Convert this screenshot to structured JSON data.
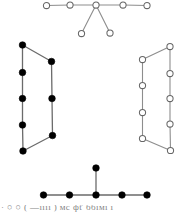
{
  "figure": {
    "background_color": "#ffffff",
    "width": 187,
    "height": 215,
    "node_open_fill": "#ffffff",
    "node_open_stroke": "#676767",
    "node_filled_fill": "#000000",
    "edge_color": "#8d8d8d",
    "node_radius_open": 3.1,
    "node_radius_filled": 3.3
  },
  "caption": {
    "text": "·  ○ ○  ( —ıııı )   мс фť ббıмı  ı",
    "visible": true,
    "cropped": true
  },
  "graphs": [
    {
      "id": "graph-top",
      "name": "top-spider-graph",
      "node_style": "open",
      "node_count": 7,
      "edge_count": 6,
      "nodes": [
        {
          "id": "t0",
          "x": 46.5,
          "y": 5.5
        },
        {
          "id": "t1",
          "x": 70.0,
          "y": 5.0
        },
        {
          "id": "t2",
          "x": 96.0,
          "y": 5.0
        },
        {
          "id": "t3",
          "x": 123.0,
          "y": 5.0
        },
        {
          "id": "t4",
          "x": 147.0,
          "y": 5.5
        },
        {
          "id": "t5",
          "x": 81.5,
          "y": 33.5
        },
        {
          "id": "t6",
          "x": 110.0,
          "y": 33.0
        }
      ],
      "edges": [
        [
          "t0",
          "t1"
        ],
        [
          "t1",
          "t2"
        ],
        [
          "t2",
          "t3"
        ],
        [
          "t3",
          "t4"
        ],
        [
          "t2",
          "t5"
        ],
        [
          "t2",
          "t6"
        ]
      ]
    },
    {
      "id": "graph-left",
      "name": "left-cycle-graph",
      "node_style": "filled",
      "node_count": 8,
      "edge_count": 8,
      "nodes": [
        {
          "id": "l0",
          "x": 22.5,
          "y": 45.0
        },
        {
          "id": "l1",
          "x": 22.5,
          "y": 72.5
        },
        {
          "id": "l2",
          "x": 22.5,
          "y": 98.5
        },
        {
          "id": "l3",
          "x": 22.5,
          "y": 125.0
        },
        {
          "id": "l4",
          "x": 23.0,
          "y": 151.0
        },
        {
          "id": "l5",
          "x": 51.5,
          "y": 61.5
        },
        {
          "id": "l6",
          "x": 52.0,
          "y": 98.5
        },
        {
          "id": "l7",
          "x": 52.5,
          "y": 135.5
        }
      ],
      "edges": [
        [
          "l0",
          "l1"
        ],
        [
          "l1",
          "l2"
        ],
        [
          "l2",
          "l3"
        ],
        [
          "l3",
          "l4"
        ],
        [
          "l0",
          "l5"
        ],
        [
          "l5",
          "l6"
        ],
        [
          "l6",
          "l7"
        ],
        [
          "l7",
          "l4"
        ]
      ]
    },
    {
      "id": "graph-right",
      "name": "right-cycle-graph",
      "node_style": "open",
      "node_count": 9,
      "edge_count": 9,
      "nodes": [
        {
          "id": "r0",
          "x": 170.0,
          "y": 46.5
        },
        {
          "id": "r1",
          "x": 170.0,
          "y": 73.5
        },
        {
          "id": "r2",
          "x": 170.0,
          "y": 98.5
        },
        {
          "id": "r3",
          "x": 170.0,
          "y": 124.0
        },
        {
          "id": "r4",
          "x": 170.5,
          "y": 150.5
        },
        {
          "id": "r5",
          "x": 142.5,
          "y": 59.5
        },
        {
          "id": "r6",
          "x": 142.5,
          "y": 85.5
        },
        {
          "id": "r7",
          "x": 142.5,
          "y": 112.5
        },
        {
          "id": "r8",
          "x": 142.5,
          "y": 138.5
        }
      ],
      "edges": [
        [
          "r0",
          "r1"
        ],
        [
          "r1",
          "r2"
        ],
        [
          "r2",
          "r3"
        ],
        [
          "r3",
          "r4"
        ],
        [
          "r0",
          "r5"
        ],
        [
          "r5",
          "r6"
        ],
        [
          "r6",
          "r7"
        ],
        [
          "r7",
          "r8"
        ],
        [
          "r8",
          "r4"
        ]
      ]
    },
    {
      "id": "graph-bottom",
      "name": "bottom-spider-graph",
      "node_style": "filled",
      "node_count": 6,
      "edge_count": 5,
      "nodes": [
        {
          "id": "b0",
          "x": 43.5,
          "y": 195.0
        },
        {
          "id": "b1",
          "x": 69.5,
          "y": 195.0
        },
        {
          "id": "b2",
          "x": 96.0,
          "y": 195.0
        },
        {
          "id": "b3",
          "x": 122.0,
          "y": 195.0
        },
        {
          "id": "b4",
          "x": 147.0,
          "y": 195.0
        },
        {
          "id": "b5",
          "x": 96.0,
          "y": 168.0
        }
      ],
      "edges": [
        [
          "b0",
          "b1"
        ],
        [
          "b1",
          "b2"
        ],
        [
          "b2",
          "b3"
        ],
        [
          "b3",
          "b4"
        ],
        [
          "b2",
          "b5"
        ]
      ]
    }
  ]
}
